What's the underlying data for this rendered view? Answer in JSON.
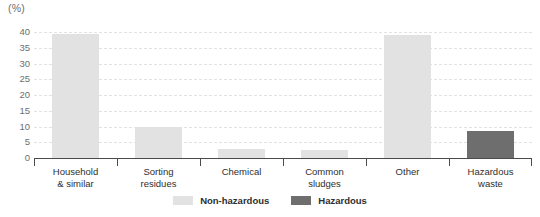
{
  "chart_data": {
    "type": "bar",
    "title": "",
    "subtitle": "",
    "xlabel": "",
    "ylabel": "",
    "unit_label": "(%)",
    "ylim": [
      0,
      40
    ],
    "yticks": [
      0,
      5,
      10,
      15,
      20,
      25,
      30,
      35,
      40
    ],
    "ytick_labels": [
      "0",
      "5",
      "10",
      "15",
      "20",
      "25",
      "30",
      "35",
      "40"
    ],
    "grid": true,
    "grid_axis": "y",
    "legend_position": "bottom-center",
    "categories": [
      "Household & similar",
      "Sorting residues",
      "Chemical",
      "Common sludges",
      "Other",
      "Hazardous waste"
    ],
    "category_lines": [
      [
        "Household",
        "& similar"
      ],
      [
        "Sorting",
        "residues"
      ],
      [
        "Chemical"
      ],
      [
        "Common",
        "sludges"
      ],
      [
        "Other"
      ],
      [
        "Hazardous",
        "waste"
      ]
    ],
    "values": [
      39.4,
      9.8,
      3.0,
      2.7,
      39.2,
      8.7
    ],
    "point_series": [
      "Non-hazardous",
      "Non-hazardous",
      "Non-hazardous",
      "Non-hazardous",
      "Non-hazardous",
      "Hazardous"
    ],
    "series": [
      {
        "name": "Non-hazardous",
        "color": "#e2e2e2",
        "values": [
          39.4,
          9.8,
          3.0,
          2.7,
          39.2,
          null
        ]
      },
      {
        "name": "Hazardous",
        "color": "#6e6e6e",
        "values": [
          null,
          null,
          null,
          null,
          null,
          8.7
        ]
      }
    ]
  },
  "legend": {
    "items": [
      {
        "label": "Non-hazardous",
        "color": "#e2e2e2"
      },
      {
        "label": "Hazardous",
        "color": "#6e6e6e"
      }
    ]
  },
  "colors": {
    "non_hazardous": "#e2e2e2",
    "hazardous": "#6e6e6e",
    "axis": "#4a4a4a",
    "grid": "#e2e2e6",
    "tick_text": "#6e6e6e",
    "label_text": "#2e2e2e",
    "background": "#ffffff"
  }
}
